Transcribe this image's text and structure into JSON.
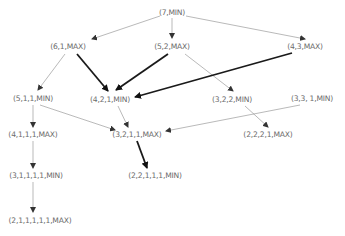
{
  "diagram": {
    "title": "",
    "nodes": [
      {
        "id": "n7",
        "label": "(7,MIN)",
        "x": 172,
        "y": 12
      },
      {
        "id": "n61",
        "label": "(6,1,MAX)",
        "x": 68,
        "y": 46
      },
      {
        "id": "n52",
        "label": "(5,2,MAX)",
        "x": 172,
        "y": 46
      },
      {
        "id": "n43",
        "label": "(4,3,MAX)",
        "x": 305,
        "y": 46
      },
      {
        "id": "n511",
        "label": "(5,1,1,MIN)",
        "x": 33,
        "y": 98
      },
      {
        "id": "n421",
        "label": "(4,2,1,MIN)",
        "x": 110,
        "y": 99
      },
      {
        "id": "n322",
        "label": "(3,2,2,MIN)",
        "x": 232,
        "y": 99
      },
      {
        "id": "n331",
        "label": "(3,3, 1,MIN)",
        "x": 312,
        "y": 98
      },
      {
        "id": "n4111",
        "label": "(4,1,1,1,MAX)",
        "x": 33,
        "y": 134
      },
      {
        "id": "n3211",
        "label": "(3,2,1,1,MAX)",
        "x": 137,
        "y": 134
      },
      {
        "id": "n2221",
        "label": "(2,2,2,1,MAX)",
        "x": 268,
        "y": 134
      },
      {
        "id": "n31111",
        "label": "(3,1,1,1,1,MIN)",
        "x": 36,
        "y": 175
      },
      {
        "id": "n22111",
        "label": "(2,2,1,1,1,MIN)",
        "x": 155,
        "y": 175
      },
      {
        "id": "n211111",
        "label": "(2,1,1,1,1,1,MAX)",
        "x": 40,
        "y": 220
      }
    ],
    "edges": [
      {
        "from": "n7",
        "to": "n61",
        "x1": 160,
        "y1": 16,
        "x2": 92,
        "y2": 39,
        "bold": false
      },
      {
        "from": "n7",
        "to": "n52",
        "x1": 172,
        "y1": 18,
        "x2": 172,
        "y2": 38,
        "bold": false
      },
      {
        "from": "n7",
        "to": "n43",
        "x1": 186,
        "y1": 16,
        "x2": 305,
        "y2": 39,
        "bold": false
      },
      {
        "from": "n61",
        "to": "n511",
        "x1": 65,
        "y1": 54,
        "x2": 38,
        "y2": 90,
        "bold": false
      },
      {
        "from": "n61",
        "to": "n421",
        "x1": 77,
        "y1": 54,
        "x2": 108,
        "y2": 91,
        "bold": true
      },
      {
        "from": "n52",
        "to": "n421",
        "x1": 168,
        "y1": 54,
        "x2": 116,
        "y2": 90,
        "bold": true
      },
      {
        "from": "n52",
        "to": "n322",
        "x1": 185,
        "y1": 54,
        "x2": 233,
        "y2": 91,
        "bold": false
      },
      {
        "from": "n43",
        "to": "n421",
        "x1": 292,
        "y1": 53,
        "x2": 135,
        "y2": 97,
        "bold": true
      },
      {
        "from": "n511",
        "to": "n4111",
        "x1": 33,
        "y1": 105,
        "x2": 33,
        "y2": 127,
        "bold": false
      },
      {
        "from": "n511",
        "to": "n3211",
        "x1": 40,
        "y1": 105,
        "x2": 115,
        "y2": 130,
        "bold": false
      },
      {
        "from": "n421",
        "to": "n3211",
        "x1": 118,
        "y1": 106,
        "x2": 128,
        "y2": 127,
        "bold": false
      },
      {
        "from": "n331",
        "to": "n3211",
        "x1": 300,
        "y1": 105,
        "x2": 166,
        "y2": 131,
        "bold": false
      },
      {
        "from": "n322",
        "to": "n2221",
        "x1": 245,
        "y1": 106,
        "x2": 268,
        "y2": 127,
        "bold": false
      },
      {
        "from": "n3211",
        "to": "n22111",
        "x1": 137,
        "y1": 141,
        "x2": 147,
        "y2": 168,
        "bold": true
      },
      {
        "from": "n4111",
        "to": "n31111",
        "x1": 33,
        "y1": 141,
        "x2": 33,
        "y2": 168,
        "bold": false
      },
      {
        "from": "n31111",
        "to": "n211111",
        "x1": 33,
        "y1": 182,
        "x2": 33,
        "y2": 212,
        "bold": false
      }
    ],
    "colors": {
      "edge": "#8a8a8a",
      "edge_bold": "#1a1a1a",
      "text": "#6b6b6b"
    }
  }
}
